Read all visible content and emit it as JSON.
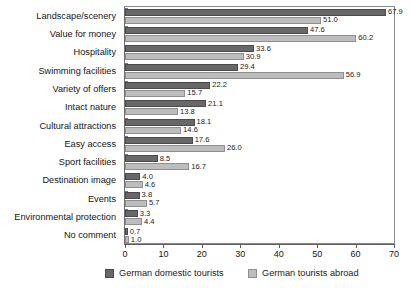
{
  "chart_data": {
    "type": "bar",
    "orientation": "horizontal",
    "title": "",
    "xlabel": "",
    "ylabel": "",
    "xlim": [
      0,
      70
    ],
    "xticks": [
      0,
      10,
      20,
      30,
      40,
      50,
      60,
      70
    ],
    "grid": false,
    "legend_position": "bottom",
    "categories": [
      "Landscape/scenery",
      "Value for money",
      "Hospitality",
      "Swimming facilities",
      "Variety of offers",
      "Intact nature",
      "Cultural attractions",
      "Easy access",
      "Sport facilities",
      "Destination image",
      "Events",
      "Environmental protection",
      "No comment"
    ],
    "series": [
      {
        "name": "German domestic tourists",
        "color": "#686868",
        "values": [
          67.9,
          47.6,
          33.6,
          29.4,
          22.2,
          21.1,
          18.1,
          17.6,
          8.5,
          4.0,
          3.8,
          3.3,
          0.7
        ]
      },
      {
        "name": "German tourists abroad",
        "color": "#bdbdbd",
        "values": [
          51.0,
          60.2,
          30.9,
          56.9,
          15.7,
          13.8,
          14.6,
          26.0,
          16.7,
          4.6,
          5.7,
          4.4,
          1.0
        ]
      }
    ],
    "value_labels": {
      "German domestic tourists": [
        "67.9",
        "47.6",
        "33.6",
        "29.4",
        "22.2",
        "21.1",
        "18.1",
        "17.6",
        "8.5",
        "4.0",
        "3.8",
        "3.3",
        "0.7"
      ],
      "German tourists abroad": [
        "51.0",
        "60.2",
        "30.9",
        "56.9",
        "15.7",
        "13.8",
        "14.6",
        "26.0",
        "16.7",
        "4.6",
        "5.7",
        "4.4",
        "1.0"
      ]
    },
    "xtick_labels": [
      "0",
      "10",
      "20",
      "30",
      "40",
      "50",
      "60",
      "70"
    ]
  }
}
